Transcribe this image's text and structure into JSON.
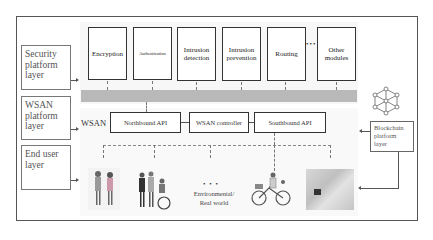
{
  "layers": {
    "security": "Security platform layer",
    "wsan": "WSAN platform layer",
    "end_user": "End user layer",
    "blockchain": "Blockchain platform layer"
  },
  "modules": [
    {
      "label": "Encryption"
    },
    {
      "label": "Authentication"
    },
    {
      "label": "Intrusion detection"
    },
    {
      "label": "Intrusion prevention"
    },
    {
      "label": "Routing"
    },
    {
      "label": "Other modules"
    }
  ],
  "modules_ellipsis": "•••",
  "wsan": {
    "label": "WSAN",
    "northbound": "Northbound API",
    "controller": "WSAN controller",
    "southbound": "Southbound API"
  },
  "real_world": {
    "dots": "• • •",
    "label_line1": "Environmental/",
    "label_line2": "Real world"
  },
  "colors": {
    "frame": "#555555",
    "gray_bar": "#b9b9b9",
    "region_bg": "#f7f7f7"
  }
}
